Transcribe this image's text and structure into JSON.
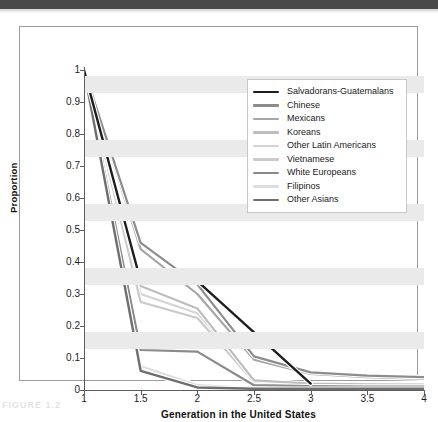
{
  "figure": {
    "caption_remnant": "FIGURE 1.2"
  },
  "chart_data": {
    "type": "line",
    "title": "",
    "xlabel": "Generation in the United States",
    "ylabel": "Proportion",
    "x": [
      1,
      1.5,
      2,
      2.5,
      3,
      3.5,
      4
    ],
    "xticks": [
      "1",
      "1.5",
      "2",
      "2.5",
      "3",
      "3.5",
      "4"
    ],
    "yticks": [
      "0",
      "0.1",
      "0.2",
      "0.3",
      "0.4",
      "0.5",
      "0.6",
      "0.7",
      "0.8",
      "0.9",
      "1"
    ],
    "xlim": [
      1,
      4
    ],
    "ylim": [
      0,
      1
    ],
    "grid": "horizontal-bands",
    "legend_position": "top-right-inside",
    "series": [
      {
        "name": "Salvadorans-Guatemalans",
        "color": "#1e1e1e",
        "width": 2.4,
        "x": [
          1,
          1.5,
          2,
          2.5,
          3
        ],
        "values": [
          1.0,
          0.34,
          0.34,
          0.18,
          0.02
        ]
      },
      {
        "name": "Chinese",
        "color": "#8c8c8c",
        "width": 2.2,
        "x": [
          1,
          1.5,
          2,
          2.5,
          3,
          3.5,
          4
        ],
        "values": [
          1.0,
          0.46,
          0.33,
          0.105,
          0.055,
          0.045,
          0.04
        ]
      },
      {
        "name": "Mexicans",
        "color": "#a6a6a6",
        "width": 2.2,
        "x": [
          1,
          1.5,
          2,
          2.5,
          3,
          3.5,
          4
        ],
        "values": [
          1.0,
          0.44,
          0.3,
          0.095,
          0.05,
          0.04,
          0.035
        ]
      },
      {
        "name": "Koreans",
        "color": "#bdbdbd",
        "width": 2.2,
        "x": [
          1,
          1.5,
          2,
          2.5,
          3,
          3.5,
          4
        ],
        "values": [
          1.0,
          0.325,
          0.255,
          0.03,
          0.02,
          0.018,
          0.017
        ]
      },
      {
        "name": "Other Latin Americans",
        "color": "#d4d4d4",
        "width": 2.2,
        "x": [
          1,
          1.5,
          2,
          2.5,
          3,
          3.5,
          4
        ],
        "values": [
          1.0,
          0.3,
          0.24,
          0.028,
          0.018,
          0.016,
          0.015
        ]
      },
      {
        "name": "Vietnamese",
        "color": "#cacaca",
        "width": 2.2,
        "x": [
          1,
          1.5,
          2,
          2.5,
          3,
          3.5,
          4
        ],
        "values": [
          1.0,
          0.275,
          0.225,
          0.025,
          0.015,
          0.014,
          0.013
        ]
      },
      {
        "name": "White Europeans",
        "color": "#8a8a8a",
        "width": 2.2,
        "x": [
          1,
          1.5,
          2,
          2.5,
          3,
          3.5,
          4
        ],
        "values": [
          1.0,
          0.125,
          0.12,
          0.015,
          0.012,
          0.011,
          0.011
        ]
      },
      {
        "name": "Filipinos",
        "color": "#dedede",
        "width": 2.2,
        "x": [
          1,
          1.5,
          2,
          2.5,
          3,
          3.5,
          4
        ],
        "values": [
          1.0,
          0.075,
          0.015,
          0.006,
          0.005,
          0.005,
          0.005
        ]
      },
      {
        "name": "Other Asians",
        "color": "#6e6e6e",
        "width": 2.4,
        "x": [
          1,
          1.5,
          2,
          2.5,
          3,
          3.5,
          4
        ],
        "values": [
          1.0,
          0.06,
          0.008,
          0.004,
          0.004,
          0.004,
          0.004
        ]
      }
    ]
  }
}
